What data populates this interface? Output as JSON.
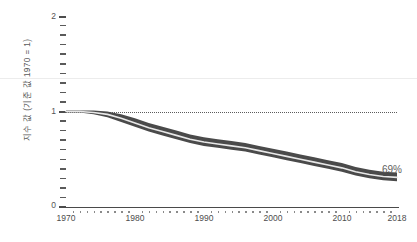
{
  "chart_data": {
    "type": "line",
    "title": "",
    "subtitle": "",
    "xlabel": "",
    "ylabel": "지수 값 (기준 값 1970 = 1)",
    "xlim": [
      1970,
      2018
    ],
    "ylim": [
      0,
      2
    ],
    "grid": false,
    "legend_position": "none",
    "x_tick_labels": [
      "1970",
      "1980",
      "1990",
      "2000",
      "2010",
      "2018"
    ],
    "x_ticks": [
      1970,
      1980,
      1990,
      2000,
      2010,
      2018
    ],
    "y_tick_labels": [
      "0",
      "1",
      "2"
    ],
    "y_ticks": [
      0,
      1,
      2
    ],
    "y_minor_tick_step": 0.1,
    "reference_line": {
      "value": 1,
      "style": "dotted",
      "label": ""
    },
    "annotations": [
      {
        "text": "69%",
        "x": 2018,
        "y": 0.33
      }
    ],
    "series": [
      {
        "name": "index",
        "kind": "line_with_band",
        "x": [
          1970,
          1972,
          1974,
          1976,
          1978,
          1980,
          1982,
          1984,
          1986,
          1988,
          1990,
          1992,
          1994,
          1996,
          1998,
          2000,
          2002,
          2004,
          2006,
          2008,
          2010,
          2012,
          2014,
          2016,
          2018
        ],
        "values": [
          1.0,
          1.0,
          0.99,
          0.97,
          0.93,
          0.88,
          0.83,
          0.79,
          0.75,
          0.71,
          0.68,
          0.66,
          0.64,
          0.62,
          0.59,
          0.56,
          0.53,
          0.5,
          0.47,
          0.44,
          0.41,
          0.37,
          0.34,
          0.32,
          0.31
        ],
        "band_upper": [
          1.01,
          1.01,
          1.01,
          1.0,
          0.97,
          0.93,
          0.88,
          0.84,
          0.8,
          0.76,
          0.73,
          0.71,
          0.69,
          0.67,
          0.64,
          0.61,
          0.58,
          0.55,
          0.52,
          0.49,
          0.46,
          0.42,
          0.39,
          0.37,
          0.36
        ],
        "band_lower": [
          0.99,
          0.99,
          0.97,
          0.94,
          0.89,
          0.84,
          0.79,
          0.75,
          0.71,
          0.67,
          0.64,
          0.62,
          0.6,
          0.58,
          0.55,
          0.52,
          0.49,
          0.46,
          0.43,
          0.4,
          0.37,
          0.33,
          0.3,
          0.28,
          0.27
        ]
      }
    ]
  },
  "colors": {
    "band": "#4a4a4a",
    "line": "#e8e8e8",
    "axis": "#4a4a4a",
    "text": "#555555",
    "gridline": "#ececec",
    "reference": "#5c5c5c",
    "annotation": "#5e5e5e"
  },
  "axis": {
    "y_label": "지수 값 (기준 값 1970 = 1)",
    "y_major_0": "0",
    "y_major_1": "1",
    "y_major_2": "2",
    "x_1970": "1970",
    "x_1980": "1980",
    "x_1990": "1990",
    "x_2000": "2000",
    "x_2010": "2010",
    "x_2018": "2018"
  },
  "annotation": {
    "end_value": "69%"
  }
}
